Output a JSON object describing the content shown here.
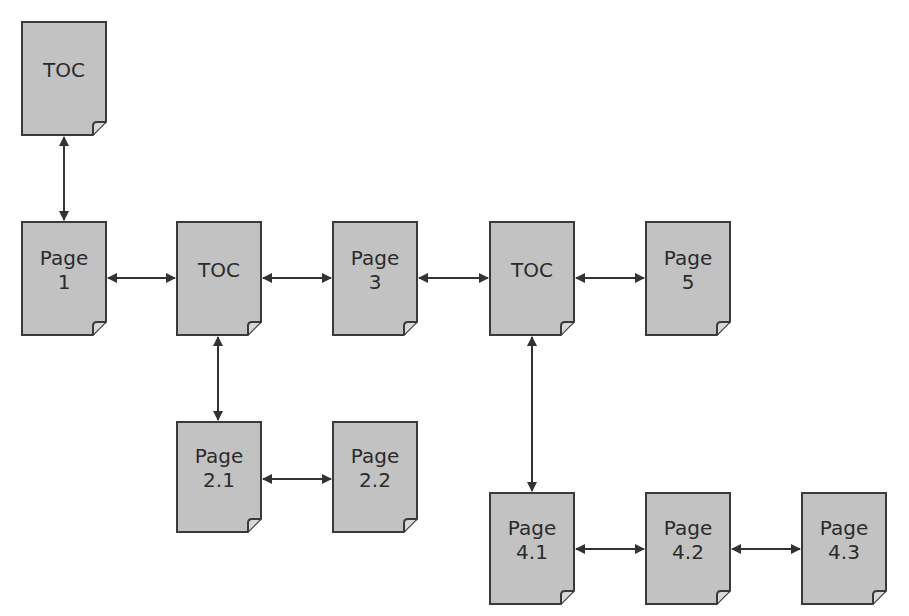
{
  "diagram": {
    "title": "",
    "colors": {
      "page_fill": "#c2c2c2",
      "page_border": "#3a3a3a",
      "arrow": "#333333",
      "text": "#2b2b2b",
      "background": "#ffffff"
    },
    "nodes": [
      {
        "id": "toc_top",
        "line1": "TOC",
        "line2": "",
        "x": 21,
        "y": 21,
        "w": 86,
        "h": 115
      },
      {
        "id": "page_1",
        "line1": "Page",
        "line2": "1",
        "x": 21,
        "y": 221,
        "w": 86,
        "h": 115
      },
      {
        "id": "toc_2",
        "line1": "TOC",
        "line2": "",
        "x": 176,
        "y": 221,
        "w": 86,
        "h": 115
      },
      {
        "id": "page_3",
        "line1": "Page",
        "line2": "3",
        "x": 332,
        "y": 221,
        "w": 86,
        "h": 115
      },
      {
        "id": "toc_4",
        "line1": "TOC",
        "line2": "",
        "x": 489,
        "y": 221,
        "w": 86,
        "h": 115
      },
      {
        "id": "page_5",
        "line1": "Page",
        "line2": "5",
        "x": 645,
        "y": 221,
        "w": 86,
        "h": 115
      },
      {
        "id": "page_2_1",
        "line1": "Page",
        "line2": "2.1",
        "x": 176,
        "y": 421,
        "w": 86,
        "h": 112
      },
      {
        "id": "page_2_2",
        "line1": "Page",
        "line2": "2.2",
        "x": 332,
        "y": 421,
        "w": 86,
        "h": 112
      },
      {
        "id": "page_4_1",
        "line1": "Page",
        "line2": "4.1",
        "x": 489,
        "y": 492,
        "w": 86,
        "h": 113
      },
      {
        "id": "page_4_2",
        "line1": "Page",
        "line2": "4.2",
        "x": 645,
        "y": 492,
        "w": 86,
        "h": 113
      },
      {
        "id": "page_4_3",
        "line1": "Page",
        "line2": "4.3",
        "x": 801,
        "y": 492,
        "w": 86,
        "h": 113
      }
    ],
    "edges": [
      {
        "from": "toc_top",
        "to": "page_1",
        "bidirectional": true,
        "x1": 64,
        "y1": 137,
        "x2": 64,
        "y2": 220
      },
      {
        "from": "page_1",
        "to": "toc_2",
        "bidirectional": true,
        "x1": 108,
        "y1": 278,
        "x2": 175,
        "y2": 278
      },
      {
        "from": "toc_2",
        "to": "page_3",
        "bidirectional": true,
        "x1": 263,
        "y1": 278,
        "x2": 331,
        "y2": 278
      },
      {
        "from": "page_3",
        "to": "toc_4",
        "bidirectional": true,
        "x1": 419,
        "y1": 278,
        "x2": 488,
        "y2": 278
      },
      {
        "from": "toc_4",
        "to": "page_5",
        "bidirectional": true,
        "x1": 576,
        "y1": 278,
        "x2": 644,
        "y2": 278
      },
      {
        "from": "toc_2",
        "to": "page_2_1",
        "bidirectional": true,
        "x1": 218,
        "y1": 337,
        "x2": 218,
        "y2": 420
      },
      {
        "from": "page_2_1",
        "to": "page_2_2",
        "bidirectional": true,
        "x1": 263,
        "y1": 479,
        "x2": 331,
        "y2": 479
      },
      {
        "from": "toc_4",
        "to": "page_4_1",
        "bidirectional": true,
        "x1": 532,
        "y1": 337,
        "x2": 532,
        "y2": 491
      },
      {
        "from": "page_4_1",
        "to": "page_4_2",
        "bidirectional": true,
        "x1": 576,
        "y1": 549,
        "x2": 644,
        "y2": 549
      },
      {
        "from": "page_4_2",
        "to": "page_4_3",
        "bidirectional": true,
        "x1": 732,
        "y1": 549,
        "x2": 800,
        "y2": 549
      }
    ]
  }
}
